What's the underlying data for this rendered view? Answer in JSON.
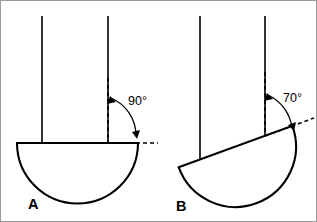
{
  "figure": {
    "background_color": "#ffffff",
    "stroke_color": "#000000",
    "frame_color": "#9a9a9a",
    "width": 317,
    "height": 222
  },
  "panels": [
    {
      "id": "A",
      "label": "A",
      "angle_label": "90°",
      "angle_value": 90,
      "description": "Bowl hanging level; the rim line meets the vertical support at a right angle",
      "tilt_degrees": 0,
      "posts": [
        {
          "name": "left-post",
          "x": 42,
          "y_top": 16,
          "y_bottom": 143
        },
        {
          "name": "right-post",
          "x": 108,
          "y_top": 16,
          "y_bottom": 143
        }
      ],
      "rim": {
        "x1": 17,
        "y1": 143,
        "x2": 138,
        "y2": 143
      },
      "bowl_radius": 60.5,
      "dashed_vertical": {
        "x": 108,
        "y_top": 78,
        "y_bottom": 143
      },
      "dashed_horizontal": {
        "x1": 108,
        "y1": 143,
        "x2": 158,
        "y2": 143
      },
      "angle_text_pos": {
        "x": 128,
        "y": 105
      },
      "label_pos": {
        "x": 28,
        "y": 209
      }
    },
    {
      "id": "B",
      "label": "B",
      "angle_label": "70°",
      "angle_value": 70,
      "description": "Bowl tilted by 20 degrees; the rim line meets the vertical support at 70 degrees",
      "tilt_degrees": 20,
      "posts": [
        {
          "name": "left-post",
          "x": 200,
          "y_top": 16,
          "y_bottom": 160
        },
        {
          "name": "right-post",
          "x": 265,
          "y_top": 16,
          "y_bottom": 136
        }
      ],
      "rim": {
        "x1": 179,
        "y1": 167,
        "x2": 292,
        "y2": 126
      },
      "bowl_radius": 60.5,
      "dashed_vertical": {
        "x": 265,
        "y_top": 72,
        "y_bottom": 136
      },
      "dashed_horizontal": {
        "x1": 265,
        "y1": 136,
        "x2": 314,
        "y2": 118
      },
      "angle_text_pos": {
        "x": 283,
        "y": 102
      },
      "label_pos": {
        "x": 176,
        "y": 211
      }
    }
  ]
}
